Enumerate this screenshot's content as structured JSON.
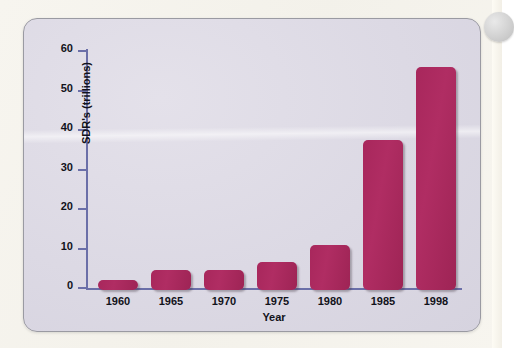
{
  "page": {
    "background_color": "#f7f5ef",
    "panel_background_color": "#dcd9e4",
    "panel_border_color": "#9a9aa2",
    "axis_color": "#6b6fa8",
    "bar_color": "#a8275c",
    "text_color": "#12121a"
  },
  "artifacts": {
    "edge_circle_name": "page-edge-circle"
  },
  "chart_data": {
    "type": "bar",
    "title": "",
    "xlabel": "Year",
    "ylabel": "SDR's (trillions)",
    "categories": [
      "1960",
      "1965",
      "1970",
      "1975",
      "1980",
      "1985",
      "1998"
    ],
    "values": [
      2.5,
      5,
      5,
      7,
      11.5,
      38,
      56.5
    ],
    "ylim": [
      0,
      60
    ],
    "yticks": [
      0,
      10,
      20,
      30,
      40,
      50,
      60
    ],
    "ytick_labels": [
      "0",
      "10",
      "20",
      "30",
      "40",
      "50",
      "60"
    ],
    "grid": false,
    "legend": false,
    "bar_color": "#a8275c",
    "axis_color": "#6b6fa8"
  }
}
